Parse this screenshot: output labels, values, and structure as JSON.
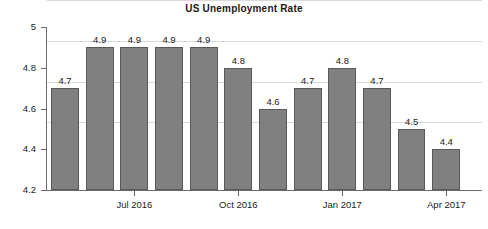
{
  "chart_data": {
    "type": "bar",
    "title": "US Unemployment Rate",
    "xlabel": "",
    "ylabel": "",
    "ylim": [
      4.2,
      5
    ],
    "yticks": [
      4.2,
      4.4,
      4.6,
      4.8,
      5
    ],
    "ytick_labels": [
      "4.2",
      "4.4",
      "4.6",
      "4.8",
      "5"
    ],
    "grid": true,
    "legend": null,
    "categories": [
      "May 2016",
      "Jun 2016",
      "Jul 2016",
      "Aug 2016",
      "Sep 2016",
      "Oct 2016",
      "Nov 2016",
      "Dec 2016",
      "Jan 2017",
      "Feb 2017",
      "Mar 2017",
      "Apr 2017"
    ],
    "values": [
      4.7,
      4.9,
      4.9,
      4.9,
      4.9,
      4.8,
      4.6,
      4.7,
      4.8,
      4.7,
      4.5,
      4.4
    ],
    "data_labels": [
      "4.7",
      "4.9",
      "4.9",
      "4.9",
      "4.9",
      "4.8",
      "4.6",
      "4.7",
      "4.8",
      "4.7",
      "4.5",
      "4.4"
    ],
    "xtick_labels": [
      {
        "label": "Jul 2016",
        "index": 2
      },
      {
        "label": "Oct 2016",
        "index": 5
      },
      {
        "label": "Jan 2017",
        "index": 8
      },
      {
        "label": "Apr 2017",
        "index": 11
      }
    ],
    "bar_color": "#808080",
    "bar_border_color": "#595959",
    "grid_color": "#d9d9d9",
    "axis_color": "#6b6b6b",
    "text_color": "#1a1a1a"
  }
}
